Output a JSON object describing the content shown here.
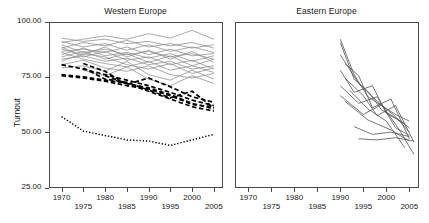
{
  "figure": {
    "ylabel": "Turnout",
    "y_ticks": [
      "100.00",
      "75.00",
      "50.00",
      "25.00"
    ],
    "x_ticks": [
      "1970",
      "1975",
      "1980",
      "1985",
      "1990",
      "1995",
      "2000",
      "2005"
    ],
    "panel_left_title": "Western Europe",
    "panel_right_title": "Eastern Europe"
  },
  "chart_data": {
    "type": "line",
    "title": "",
    "xlabel": "",
    "ylabel": "Turnout",
    "xlim": [
      1967,
      2007
    ],
    "ylim": [
      25,
      100
    ],
    "grid": false,
    "legend": "none",
    "x_ticks": [
      1970,
      1975,
      1980,
      1985,
      1990,
      1995,
      2000,
      2005
    ],
    "y_ticks": [
      25,
      50,
      75,
      100
    ],
    "panels": [
      {
        "title": "Western Europe",
        "series": [
          {
            "name": "we-solid-01",
            "style": "solid-gray",
            "x": [
              1970,
              1975,
              1980,
              1985,
              1990,
              1995,
              2000,
              2005
            ],
            "y": [
              90.5,
              92.0,
              93.5,
              92.0,
              94.5,
              92.5,
              96.0,
              92.0
            ]
          },
          {
            "name": "we-solid-02",
            "style": "solid-gray",
            "x": [
              1970,
              1975,
              1980,
              1985,
              1990,
              1995,
              2000,
              2005
            ],
            "y": [
              88.0,
              90.5,
              89.0,
              91.5,
              88.5,
              90.0,
              88.0,
              89.5
            ]
          },
          {
            "name": "we-solid-03",
            "style": "solid-gray",
            "x": [
              1970,
              1975,
              1980,
              1985,
              1990,
              1995,
              2000,
              2005
            ],
            "y": [
              91.0,
              88.5,
              90.0,
              87.0,
              89.5,
              86.5,
              88.5,
              86.0
            ]
          },
          {
            "name": "we-solid-04",
            "style": "solid-gray",
            "x": [
              1970,
              1975,
              1980,
              1985,
              1990,
              1995,
              2000,
              2005
            ],
            "y": [
              86.5,
              87.5,
              86.0,
              88.5,
              85.0,
              87.5,
              84.5,
              85.5
            ]
          },
          {
            "name": "we-solid-05",
            "style": "solid-gray",
            "x": [
              1970,
              1975,
              1980,
              1985,
              1990,
              1995,
              2000,
              2005
            ],
            "y": [
              89.5,
              86.0,
              87.5,
              85.0,
              86.5,
              84.0,
              85.5,
              83.0
            ]
          },
          {
            "name": "we-solid-06",
            "style": "solid-gray",
            "x": [
              1970,
              1975,
              1980,
              1985,
              1990,
              1995,
              2000,
              2005
            ],
            "y": [
              85.0,
              88.0,
              84.5,
              86.0,
              83.5,
              85.5,
              82.0,
              84.5
            ]
          },
          {
            "name": "we-solid-07",
            "style": "solid-gray",
            "x": [
              1970,
              1975,
              1980,
              1985,
              1990,
              1995,
              2000,
              2005
            ],
            "y": [
              87.5,
              85.0,
              88.5,
              84.0,
              87.0,
              83.0,
              86.5,
              81.5
            ]
          },
          {
            "name": "we-solid-08",
            "style": "solid-gray",
            "x": [
              1970,
              1975,
              1980,
              1985,
              1990,
              1995,
              2000,
              2005
            ],
            "y": [
              84.0,
              86.5,
              83.0,
              85.5,
              81.5,
              84.5,
              80.0,
              83.0
            ]
          },
          {
            "name": "we-solid-09",
            "style": "solid-gray",
            "x": [
              1970,
              1975,
              1980,
              1985,
              1990,
              1995,
              2000,
              2005
            ],
            "y": [
              92.5,
              91.0,
              92.0,
              90.0,
              91.0,
              89.0,
              90.5,
              88.0
            ]
          },
          {
            "name": "we-solid-10",
            "style": "solid-gray",
            "x": [
              1970,
              1975,
              1980,
              1985,
              1990,
              1995,
              2000,
              2005
            ],
            "y": [
              83.0,
              84.5,
              82.0,
              83.5,
              80.5,
              82.0,
              78.5,
              80.0
            ]
          },
          {
            "name": "we-solid-11",
            "style": "solid-gray",
            "x": [
              1970,
              1975,
              1980,
              1985,
              1990,
              1995,
              2000,
              2005
            ],
            "y": [
              88.5,
              84.0,
              86.5,
              82.5,
              84.0,
              80.5,
              82.5,
              78.5
            ]
          },
          {
            "name": "we-solid-12",
            "style": "solid-gray",
            "x": [
              1970,
              1975,
              1980,
              1985,
              1990,
              1995,
              2000,
              2005
            ],
            "y": [
              86.0,
              83.0,
              81.0,
              79.5,
              82.0,
              78.0,
              80.0,
              77.0
            ]
          },
          {
            "name": "we-solid-13",
            "style": "solid-gray",
            "x": [
              1970,
              1975,
              1980,
              1985,
              1990,
              1995,
              2000,
              2005
            ],
            "y": [
              82.0,
              85.5,
              84.0,
              80.5,
              78.5,
              81.0,
              76.5,
              79.0
            ]
          },
          {
            "name": "we-solid-14",
            "style": "solid-gray",
            "x": [
              1970,
              1975,
              1980,
              1985,
              1990,
              1995,
              2000,
              2005
            ],
            "y": [
              80.5,
              82.5,
              79.0,
              77.5,
              80.0,
              76.0,
              74.5,
              76.5
            ]
          },
          {
            "name": "we-solid-15",
            "style": "solid-gray",
            "x": [
              1970,
              1975,
              1980,
              1985,
              1990,
              1995,
              2000,
              2005
            ],
            "y": [
              79.0,
              80.0,
              77.5,
              82.0,
              76.0,
              73.5,
              78.0,
              74.0
            ]
          },
          {
            "name": "we-solid-16",
            "style": "solid-gray",
            "x": [
              1975,
              1980,
              1985,
              1990,
              1995,
              2000,
              2005
            ],
            "y": [
              78.0,
              75.5,
              79.5,
              74.0,
              71.0,
              75.5,
              72.0
            ]
          },
          {
            "name": "we-dashed-01",
            "style": "dashed-black",
            "x": [
              1970,
              1975,
              1980,
              1985,
              1990,
              1995,
              2000,
              2005
            ],
            "y": [
              80.5,
              78.5,
              76.0,
              73.5,
              71.0,
              68.0,
              64.5,
              62.0
            ]
          },
          {
            "name": "we-dashed-02",
            "style": "dashed-black",
            "x": [
              1970,
              1975,
              1980,
              1985,
              1990,
              1995,
              2000,
              2005
            ],
            "y": [
              76.0,
              75.0,
              73.5,
              72.0,
              70.0,
              67.0,
              63.0,
              60.5
            ]
          },
          {
            "name": "we-dashed-03",
            "style": "dashed-black",
            "x": [
              1970,
              1975,
              1980,
              1985,
              1990,
              1995,
              2000,
              2005
            ],
            "y": [
              75.5,
              74.5,
              73.0,
              71.0,
              69.5,
              66.5,
              62.5,
              61.5
            ]
          },
          {
            "name": "we-dashed-04",
            "style": "dashed-black",
            "x": [
              1975,
              1980,
              1985,
              1990,
              1995,
              2000,
              2005
            ],
            "y": [
              81.0,
              77.5,
              71.5,
              74.5,
              70.5,
              66.0,
              63.5
            ]
          },
          {
            "name": "we-dashed-05",
            "style": "dashed-black",
            "x": [
              1975,
              1980,
              1985,
              1990,
              1995,
              2000,
              2005
            ],
            "y": [
              79.0,
              74.0,
              72.5,
              69.0,
              65.5,
              68.5,
              61.0
            ]
          },
          {
            "name": "we-dashed-06",
            "style": "dashed-black",
            "x": [
              1980,
              1985,
              1990,
              1995,
              2000,
              2005
            ],
            "y": [
              75.5,
              72.0,
              68.5,
              65.0,
              61.5,
              59.5
            ]
          },
          {
            "name": "we-dotted-switzerland",
            "style": "dotted-black",
            "x": [
              1970,
              1975,
              1980,
              1985,
              1990,
              1995,
              2000,
              2005
            ],
            "y": [
              57.0,
              50.5,
              48.5,
              46.5,
              46.0,
              44.0,
              46.5,
              49.0
            ]
          }
        ]
      },
      {
        "title": "Eastern Europe",
        "series": [
          {
            "name": "ee-line-01",
            "style": "solid-dark",
            "x": [
              1990,
              1993,
              1996,
              1999,
              2002,
              2005
            ],
            "y": [
              92.0,
              76.0,
              66.0,
              62.0,
              58.0,
              55.0
            ]
          },
          {
            "name": "ee-line-02",
            "style": "solid-dark",
            "x": [
              1990,
              1993,
              1996,
              1999,
              2002,
              2005
            ],
            "y": [
              90.5,
              74.0,
              68.5,
              60.0,
              56.5,
              52.0
            ]
          },
          {
            "name": "ee-line-03",
            "style": "solid-dark",
            "x": [
              1990,
              1994,
              1998,
              2002,
              2005
            ],
            "y": [
              85.0,
              72.0,
              64.0,
              57.0,
              50.0
            ]
          },
          {
            "name": "ee-line-04",
            "style": "solid-dark",
            "x": [
              1991,
              1994,
              1997,
              2001,
              2005
            ],
            "y": [
              81.0,
              75.5,
              61.0,
              65.0,
              47.0
            ]
          },
          {
            "name": "ee-line-05",
            "style": "solid-dark",
            "x": [
              1990,
              1993,
              1997,
              2000,
              2004
            ],
            "y": [
              78.0,
              68.0,
              71.0,
              58.5,
              54.0
            ]
          },
          {
            "name": "ee-line-06",
            "style": "solid-dark",
            "x": [
              1991,
              1995,
              1998,
              2002,
              2006
            ],
            "y": [
              74.5,
              66.5,
              57.5,
              62.0,
              45.5
            ]
          },
          {
            "name": "ee-line-07",
            "style": "solid-dark",
            "x": [
              1990,
              1994,
              1998,
              2002,
              2005
            ],
            "y": [
              71.0,
              63.0,
              66.0,
              52.0,
              48.5
            ]
          },
          {
            "name": "ee-line-08",
            "style": "solid-dark",
            "x": [
              1992,
              1996,
              2000,
              2004
            ],
            "y": [
              69.0,
              60.5,
              55.0,
              43.0
            ]
          },
          {
            "name": "ee-line-09",
            "style": "solid-dark",
            "x": [
              1990,
              1995,
              1999,
              2003,
              2006
            ],
            "y": [
              66.5,
              58.0,
              62.5,
              50.5,
              40.0
            ]
          },
          {
            "name": "ee-line-10",
            "style": "solid-dark",
            "x": [
              1991,
              1996,
              2001,
              2005
            ],
            "y": [
              64.0,
              55.5,
              51.0,
              46.0
            ]
          },
          {
            "name": "ee-line-11",
            "style": "solid-dark",
            "x": [
              1993,
              1997,
              2001,
              2005
            ],
            "y": [
              52.5,
              49.0,
              50.0,
              48.0
            ]
          },
          {
            "name": "ee-line-12",
            "style": "solid-dark",
            "x": [
              1994,
              1998,
              2002,
              2006
            ],
            "y": [
              47.0,
              46.5,
              47.5,
              46.0
            ]
          }
        ]
      }
    ]
  }
}
